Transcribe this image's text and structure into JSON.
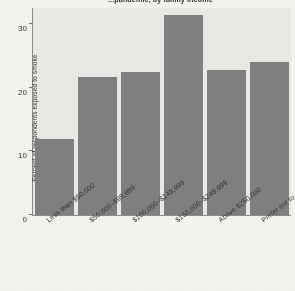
{
  "chart_data": {
    "type": "bar",
    "title": "...pandemic, by family income",
    "xlabel": "",
    "ylabel": "Percent of respondents exposed to smoke",
    "categories": [
      "Less than $50,000",
      "$50,000–$99,999",
      "$100,000–$149,999",
      "$150,000–$249,999",
      "Above $250,000",
      "Prefer not to say"
    ],
    "values": [
      11.9,
      21.6,
      22.4,
      31.4,
      22.8,
      24.0
    ],
    "ylim": [
      0,
      32.5
    ],
    "yticks": [
      0,
      10,
      20,
      30
    ],
    "ytick_labels": [
      "0",
      "10",
      "20",
      "30"
    ],
    "grid": false,
    "legend": "none",
    "bar_color": "#7d7d7d",
    "plot_background": "#eeeeea"
  }
}
